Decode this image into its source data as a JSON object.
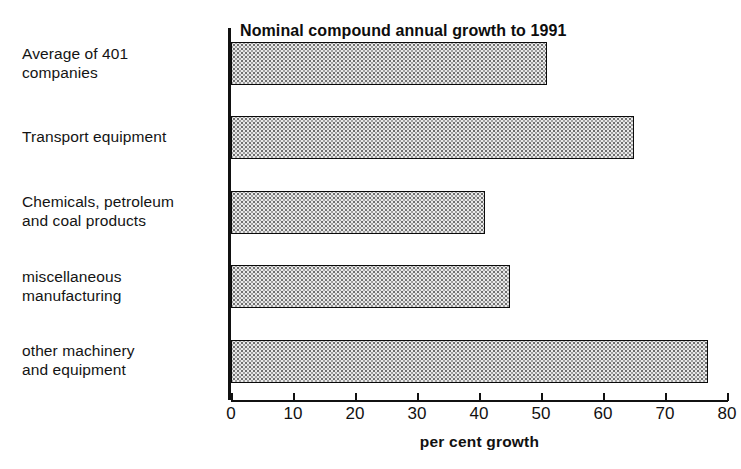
{
  "chart_data": {
    "type": "bar",
    "orientation": "horizontal",
    "title": "Nominal compound annual growth to 1991",
    "source_label": "Source",
    "source_text": ": AUSTRADE, AMC analysis",
    "source_full": "Source: AUSTRADE, AMC analysis",
    "xlabel": "per cent growth",
    "ylabel": "",
    "xlim": [
      0,
      80
    ],
    "xticks": [
      0,
      10,
      20,
      30,
      40,
      50,
      60,
      70,
      80
    ],
    "xtick_labels": [
      "0",
      "10",
      "20",
      "30",
      "40",
      "50",
      "60",
      "70",
      "80"
    ],
    "grid": false,
    "legend": false,
    "categories": [
      "Average of 401\ncompanies",
      "Transport equipment",
      "Chemicals, petroleum\nand coal products",
      "miscellaneous\nmanufacturing",
      "other machinery\nand equipment"
    ],
    "values": [
      51,
      65,
      41,
      45,
      77
    ],
    "bar_fill": "#e9e9e9",
    "bar_edge": "#0a0a0a",
    "axis_color": "#111111",
    "background": "#ffffff"
  }
}
